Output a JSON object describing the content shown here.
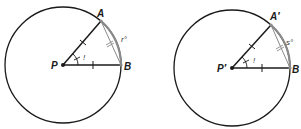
{
  "figures": [
    {
      "id": "left",
      "center_label": "P",
      "point_a_label": "A",
      "point_b_label": "B",
      "arc_label": "r°",
      "angle_label": "!"
    },
    {
      "id": "right",
      "center_label": "P′",
      "point_a_label": "A′",
      "point_b_label": "B",
      "arc_label": "s°",
      "angle_label": "!"
    }
  ],
  "colors": {
    "stroke": "#1a1a1a",
    "arc": "#8a8a8a",
    "background": "#ffffff"
  }
}
